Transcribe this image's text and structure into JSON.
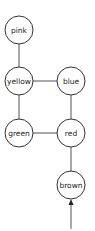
{
  "diagram": {
    "type": "graph",
    "nodes": [
      {
        "id": "pink",
        "label": "pink",
        "x": 19,
        "y": 30
      },
      {
        "id": "yellow",
        "label": "yellow",
        "x": 19,
        "y": 81
      },
      {
        "id": "blue",
        "label": "blue",
        "x": 71,
        "y": 81
      },
      {
        "id": "green",
        "label": "green",
        "x": 19,
        "y": 133
      },
      {
        "id": "red",
        "label": "red",
        "x": 71,
        "y": 133
      },
      {
        "id": "brown",
        "label": "brown",
        "x": 71,
        "y": 185
      }
    ],
    "edges": [
      {
        "from": "pink",
        "to": "yellow"
      },
      {
        "from": "yellow",
        "to": "blue"
      },
      {
        "from": "yellow",
        "to": "green"
      },
      {
        "from": "blue",
        "to": "red"
      },
      {
        "from": "green",
        "to": "red"
      },
      {
        "from": "red",
        "to": "brown"
      }
    ],
    "entry_arrow": {
      "to": "brown",
      "direction": "up"
    },
    "node_radius": 14
  }
}
